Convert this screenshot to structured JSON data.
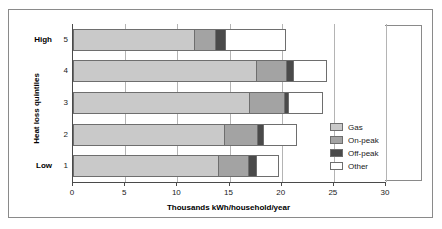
{
  "chart_data": {
    "type": "bar",
    "orientation": "horizontal",
    "stacked": true,
    "title": "",
    "xlabel": "Thousands kWh/household/year",
    "ylabel": "Heat loss quintiles",
    "categories": [
      "1",
      "2",
      "3",
      "4",
      "5"
    ],
    "category_end_labels": {
      "low": "Low",
      "high": "High"
    },
    "xlim": [
      0,
      30
    ],
    "xticks": [
      0,
      5,
      10,
      15,
      20,
      25,
      30
    ],
    "xtick_labels": [
      "0",
      "5",
      "10",
      "15",
      "20",
      "25",
      "30"
    ],
    "grid": "vertical",
    "legend_position": "right",
    "series": [
      {
        "name": "Gas",
        "color": "#c9c9c9",
        "values": [
          14.0,
          14.6,
          17.0,
          17.6,
          11.7
        ]
      },
      {
        "name": "On-peak",
        "color": "#a3a3a3",
        "values": [
          2.9,
          3.1,
          3.3,
          2.9,
          2.0
        ]
      },
      {
        "name": "Off-peak",
        "color": "#4a4a4a",
        "values": [
          0.7,
          0.6,
          0.4,
          0.7,
          1.0
        ]
      },
      {
        "name": "Other",
        "color": "#ffffff",
        "values": [
          2.1,
          3.2,
          3.3,
          3.1,
          5.7
        ]
      }
    ],
    "totals": [
      19.7,
      21.5,
      24.0,
      24.3,
      20.4
    ]
  },
  "legend": {
    "items": [
      {
        "label": "Gas"
      },
      {
        "label": "On-peak"
      },
      {
        "label": "Off-peak"
      },
      {
        "label": "Other"
      }
    ]
  },
  "axes": {
    "x_title": "Thousands kWh/household/year",
    "y_title": "Heat loss quintiles"
  },
  "colors": {
    "gas": "#c9c9c9",
    "on_peak": "#a3a3a3",
    "off_peak": "#4a4a4a",
    "other": "#ffffff",
    "gridline": "#b4b4b4",
    "axis": "#4a4a4a",
    "border": "#6e6e6e"
  }
}
